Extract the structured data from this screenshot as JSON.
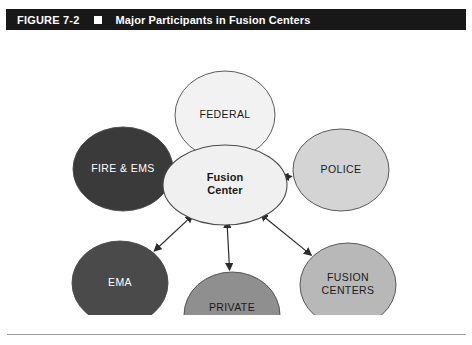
{
  "figure": {
    "number": "FIGURE 7-2",
    "bullet_icon": "square-bullet-icon",
    "caption": "Major Participants in Fusion Centers"
  },
  "colors": {
    "title_bar_bg": "#181818",
    "title_text": "#ffffff",
    "canvas_bg": "#ffffff",
    "outline": "#4a4a4a",
    "arrow": "#2b2b2b",
    "rule": "#9a9a9a"
  },
  "chart_data": {
    "type": "diagram",
    "title": "Major Participants in Fusion Centers",
    "layout": "hub-and-spoke",
    "hub": {
      "id": "fusion-center",
      "label_lines": [
        "Fusion",
        "Center"
      ],
      "label": "Fusion Center",
      "fill": "#f0f0f0",
      "text_color": "#1a1a1a",
      "bold": true,
      "cx": 225,
      "cy": 155,
      "rx": 62,
      "ry": 40
    },
    "spokes": [
      {
        "id": "federal",
        "label_lines": [
          "FEDERAL"
        ],
        "label": "FEDERAL",
        "fill": "#f2f2f2",
        "text_color": "#1a1a1a",
        "cx": 225,
        "cy": 85,
        "rx": 50,
        "ry": 44,
        "position": "top"
      },
      {
        "id": "police",
        "label_lines": [
          "POLICE"
        ],
        "label": "POLICE",
        "fill": "#d4d4d4",
        "text_color": "#1a1a1a",
        "cx": 341,
        "cy": 140,
        "rx": 48,
        "ry": 41,
        "position": "upper-right"
      },
      {
        "id": "fusion-centers",
        "label_lines": [
          "FUSION",
          "CENTERS"
        ],
        "label": "FUSION CENTERS",
        "fill": "#b8b8b8",
        "text_color": "#1a1a1a",
        "cx": 348,
        "cy": 255,
        "rx": 48,
        "ry": 42,
        "position": "lower-right"
      },
      {
        "id": "private-sector",
        "label_lines": [
          "PRIVATE",
          "SECTOR"
        ],
        "label": "PRIVATE SECTOR",
        "fill": "#8f8f8f",
        "text_color": "#1a1a1a",
        "cx": 232,
        "cy": 285,
        "rx": 48,
        "ry": 43,
        "position": "bottom"
      },
      {
        "id": "ema",
        "label_lines": [
          "EMA"
        ],
        "label": "EMA",
        "fill": "#4a4a4a",
        "text_color": "#ffffff",
        "cx": 120,
        "cy": 253,
        "rx": 48,
        "ry": 42,
        "position": "lower-left"
      },
      {
        "id": "fire-ems",
        "label_lines": [
          "FIRE & EMS"
        ],
        "label": "FIRE & EMS",
        "fill": "#3a3a3a",
        "text_color": "#ffffff",
        "cx": 123,
        "cy": 139,
        "rx": 50,
        "ry": 42,
        "position": "upper-left"
      }
    ],
    "connectors": [
      {
        "id": "connector-federal",
        "from": "fusion-center",
        "to": "federal",
        "style": "double-headed-arrow"
      },
      {
        "id": "connector-police",
        "from": "fusion-center",
        "to": "police",
        "style": "double-headed-arrow"
      },
      {
        "id": "connector-fusion-centers",
        "from": "fusion-center",
        "to": "fusion-centers",
        "style": "double-headed-arrow"
      },
      {
        "id": "connector-private-sector",
        "from": "fusion-center",
        "to": "private-sector",
        "style": "double-headed-arrow"
      },
      {
        "id": "connector-ema",
        "from": "fusion-center",
        "to": "ema",
        "style": "double-headed-arrow"
      },
      {
        "id": "connector-fire-ems",
        "from": "fusion-center",
        "to": "fire-ems",
        "style": "double-headed-arrow"
      }
    ]
  }
}
